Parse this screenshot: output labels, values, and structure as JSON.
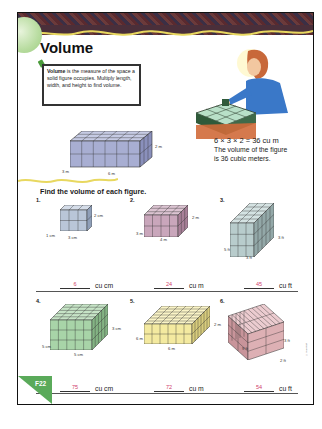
{
  "page": {
    "title": "Volume",
    "page_label": "F22",
    "definition": {
      "term": "Volume",
      "text": " is the measure of the space a solid figure occupies. Multiply length, width, and height to find volume."
    },
    "example": {
      "equation": "6 × 3 × 2 = 36 cu m",
      "explanation_line1": "The volume of the figure",
      "explanation_line2": "is 36 cubic meters.",
      "dims": {
        "width": "3 m",
        "length": "6 m",
        "height": "2 m"
      }
    },
    "instructions": "Find the volume of each figure.",
    "copyright": "© Harcourt"
  },
  "problems": [
    {
      "number": "1.",
      "dims": {
        "width": "1 cm",
        "length": "3 cm",
        "height": "2 cm"
      },
      "answer": "6",
      "unit": "cu cm",
      "color": "#b9c6d8"
    },
    {
      "number": "2.",
      "dims": {
        "width": "3 m",
        "length": "4 m",
        "height": "2 m"
      },
      "answer": "24",
      "unit": "cu m",
      "color": "#c9a6bb"
    },
    {
      "number": "3.",
      "dims": {
        "width": "5 ft",
        "length": "3 ft",
        "height": "3 ft"
      },
      "answer": "45",
      "unit": "cu ft",
      "color": "#b8cccc"
    },
    {
      "number": "4.",
      "dims": {
        "width": "5 cm",
        "length": "5 cm",
        "height": "3 cm"
      },
      "answer": "75",
      "unit": "cu cm",
      "color": "#a8d4a8"
    },
    {
      "number": "5.",
      "dims": {
        "width": "6 m",
        "length": "6 m",
        "height": "2 m"
      },
      "answer": "72",
      "unit": "cu m",
      "color": "#f4eaa0"
    },
    {
      "number": "6.",
      "dims": {
        "width": "9 ft",
        "length": "2 ft",
        "height": "3 ft"
      },
      "answer": "54",
      "unit": "cu ft",
      "color": "#ddb0b4"
    }
  ],
  "colors": {
    "answer_ink": "#d0406a",
    "tab_green": "#5aaa5a",
    "header_band": "#4a2f3a",
    "wave_yellow": "#e8d860"
  }
}
